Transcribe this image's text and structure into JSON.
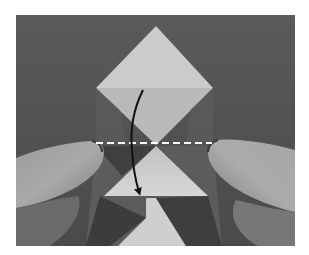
{
  "figure": {
    "type": "origami instruction photo",
    "colors": {
      "background": "#565656",
      "paper_light": "#cbcbcb",
      "paper_mid": "#b9b9b9",
      "paper_shadow": "#6a6a6a",
      "skin_light": "#a8a8a8",
      "skin_dark": "#7a7a7a",
      "fold_line": "#ffffff",
      "arrow": "#111111"
    },
    "annotations": {
      "fold_line": {
        "style": "dashed",
        "y": 143,
        "x_start": 96,
        "x_end": 212
      },
      "arrow": {
        "direction": "down",
        "start": [
          143,
          90
        ],
        "end": [
          140,
          197
        ]
      }
    }
  }
}
